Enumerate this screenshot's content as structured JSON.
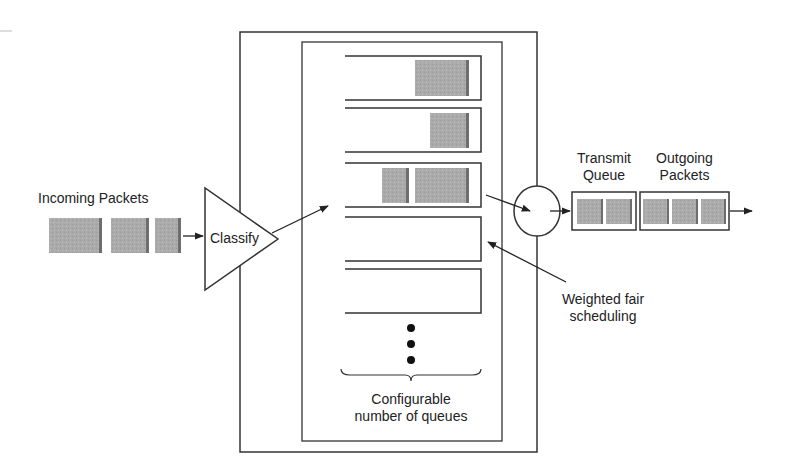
{
  "diagram": {
    "type": "weighted-fair-queuing",
    "labels": {
      "incoming": "Incoming Packets",
      "classify": "Classify",
      "transmit_line1": "Transmit",
      "transmit_line2": "Queue",
      "outgoing_line1": "Outgoing",
      "outgoing_line2": "Packets",
      "wfs_line1": "Weighted fair",
      "wfs_line2": "scheduling",
      "config_line1": "Configurable",
      "config_line2": "number of queues"
    },
    "queues": [
      {
        "packets": 1
      },
      {
        "packets": 1
      },
      {
        "packets": 2
      },
      {
        "packets": 0
      },
      {
        "packets": 0
      }
    ],
    "incoming_packets": 3,
    "transmit_queue_packets": 2,
    "outgoing_packets": 3,
    "colors": {
      "packet": "#a8a8a8",
      "packet_shade": "#6e6e6e",
      "line": "#333333"
    }
  }
}
